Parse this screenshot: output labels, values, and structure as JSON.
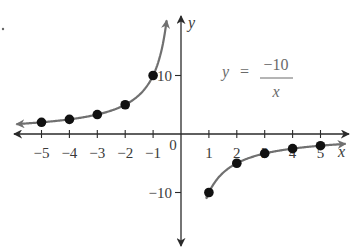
{
  "chart_data": {
    "type": "line",
    "title": "",
    "equation": {
      "lhs": "y",
      "equals": "=",
      "numerator": "−10",
      "denominator": "x"
    },
    "xlabel": "x",
    "ylabel": "y",
    "xlim": [
      -5.8,
      6.0
    ],
    "ylim": [
      -19,
      20
    ],
    "grid": false,
    "legend": "none",
    "x_ticks": [
      {
        "value": -5,
        "label": "−5"
      },
      {
        "value": -4,
        "label": "−4"
      },
      {
        "value": -3,
        "label": "−3"
      },
      {
        "value": -2,
        "label": "−2"
      },
      {
        "value": -1,
        "label": "−1"
      },
      {
        "value": 0,
        "label": "0"
      },
      {
        "value": 1,
        "label": "1"
      },
      {
        "value": 2,
        "label": "2"
      },
      {
        "value": 3,
        "label": "3"
      },
      {
        "value": 4,
        "label": "4"
      },
      {
        "value": 5,
        "label": "5"
      }
    ],
    "y_ticks": [
      {
        "value": 10,
        "label": "10"
      },
      {
        "value": -10,
        "label": "−10"
      }
    ],
    "series": [
      {
        "name": "y = -10/x (x < 0)",
        "points": [
          {
            "x": -5,
            "y": 2
          },
          {
            "x": -4,
            "y": 2.5
          },
          {
            "x": -3,
            "y": 3.33
          },
          {
            "x": -2,
            "y": 5
          },
          {
            "x": -1,
            "y": 10
          }
        ]
      },
      {
        "name": "y = -10/x (x > 0)",
        "points": [
          {
            "x": 1,
            "y": -10
          },
          {
            "x": 2,
            "y": -5
          },
          {
            "x": 3,
            "y": -3.33
          },
          {
            "x": 4,
            "y": -2.5
          },
          {
            "x": 5,
            "y": -2
          }
        ]
      }
    ],
    "colors": {
      "axis": "#2a2a2a",
      "curve": "#707070",
      "point": "#111111"
    }
  }
}
